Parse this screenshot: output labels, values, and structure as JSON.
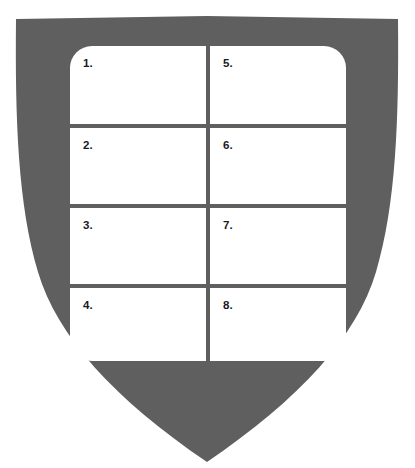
{
  "figure": {
    "shape": "shield",
    "shield_color": "#5f5f5f",
    "cell_color": "#ffffff",
    "label_color": "#1a1a1a",
    "background_color": "#ffffff"
  },
  "grid": {
    "columns": 2,
    "rows": 4,
    "cells": [
      {
        "id": "cell-1",
        "label": "1.",
        "column": 1,
        "row": 1
      },
      {
        "id": "cell-2",
        "label": "2.",
        "column": 1,
        "row": 2
      },
      {
        "id": "cell-3",
        "label": "3.",
        "column": 1,
        "row": 3
      },
      {
        "id": "cell-4",
        "label": "4.",
        "column": 1,
        "row": 4
      },
      {
        "id": "cell-5",
        "label": "5.",
        "column": 2,
        "row": 1
      },
      {
        "id": "cell-6",
        "label": "6.",
        "column": 2,
        "row": 2
      },
      {
        "id": "cell-7",
        "label": "7.",
        "column": 2,
        "row": 3
      },
      {
        "id": "cell-8",
        "label": "8.",
        "column": 2,
        "row": 4
      }
    ]
  }
}
